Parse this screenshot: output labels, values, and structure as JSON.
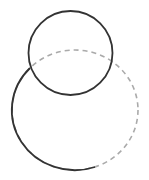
{
  "diagram": {
    "width": 149,
    "height": 180,
    "background": "#ffffff",
    "shapes": [
      {
        "id": "small-circle",
        "type": "ellipse",
        "cx": 70.5,
        "cy": 53,
        "rx": 42,
        "ry": 42,
        "stroke": "#333333",
        "style": "solid"
      },
      {
        "id": "large-circle",
        "type": "ellipse",
        "cx": 75,
        "cy": 110,
        "rx": 63,
        "ry": 60,
        "stroke_solid": "#333333",
        "stroke_dashed": "#aaaaaa",
        "solid_arc": {
          "from": [
            95,
            167
          ],
          "to": [
            30,
            68
          ]
        },
        "style": "partially-dashed"
      }
    ]
  }
}
